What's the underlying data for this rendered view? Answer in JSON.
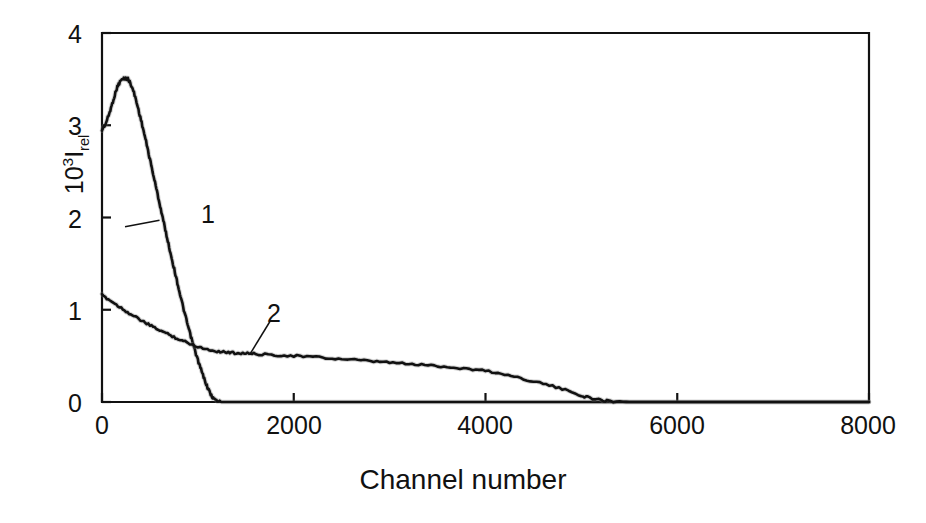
{
  "figure": {
    "background_color": "#ffffff",
    "axis_color": "#111111",
    "curve_color": "#111111"
  },
  "axes": {
    "x_title": "Channel number",
    "y_title_base": "10",
    "y_title_exponent": "3",
    "y_title_symbol": "I",
    "y_title_subscript": "rel",
    "x_ticks": [
      "0",
      "2000",
      "4000",
      "6000",
      "8000"
    ],
    "y_ticks": [
      "0",
      "1",
      "2",
      "3",
      "4"
    ]
  },
  "annotations": {
    "curve_1_label": "1",
    "curve_2_label": "2"
  },
  "chart_data": {
    "type": "line",
    "title": "",
    "xlabel": "Channel number",
    "ylabel": "10^3 I_rel",
    "xlim": [
      0,
      8000
    ],
    "ylim": [
      0,
      4
    ],
    "xticks": [
      0,
      2000,
      4000,
      6000,
      8000
    ],
    "yticks": [
      0,
      1,
      2,
      3,
      4
    ],
    "grid": false,
    "legend": "inline-labels",
    "series": [
      {
        "name": "1",
        "label": "1",
        "label_position": {
          "x": 600,
          "y": 2.03
        },
        "x": [
          0,
          40,
          80,
          120,
          160,
          200,
          240,
          270,
          300,
          340,
          380,
          420,
          460,
          500,
          540,
          580,
          620,
          660,
          700,
          740,
          780,
          820,
          860,
          900,
          940,
          980,
          1020,
          1060,
          1100,
          1140,
          1180,
          1250,
          1400,
          1800,
          2400,
          3200,
          4000,
          5000,
          6000,
          7000,
          8000
        ],
        "y": [
          2.95,
          3.02,
          3.14,
          3.28,
          3.42,
          3.49,
          3.51,
          3.5,
          3.45,
          3.33,
          3.17,
          3.0,
          2.82,
          2.63,
          2.44,
          2.25,
          2.06,
          1.87,
          1.68,
          1.5,
          1.32,
          1.14,
          0.97,
          0.81,
          0.66,
          0.52,
          0.39,
          0.27,
          0.16,
          0.07,
          0.02,
          0.0,
          0.0,
          0.0,
          0.0,
          0.0,
          0.0,
          0.0,
          0.0,
          0.0,
          0.0
        ]
      },
      {
        "name": "2",
        "label": "2",
        "label_position": {
          "x": 1800,
          "y": 0.95
        },
        "x": [
          0,
          100,
          200,
          300,
          400,
          500,
          600,
          700,
          800,
          900,
          1000,
          1100,
          1200,
          1300,
          1400,
          1500,
          1600,
          1800,
          2000,
          2200,
          2400,
          2600,
          2800,
          3000,
          3200,
          3400,
          3600,
          3800,
          4000,
          4200,
          4400,
          4600,
          4800,
          5000,
          5100,
          5200,
          5300,
          5500,
          6000,
          6500,
          7000,
          7500,
          8000
        ],
        "y": [
          1.16,
          1.09,
          1.02,
          0.95,
          0.89,
          0.83,
          0.78,
          0.73,
          0.68,
          0.64,
          0.6,
          0.57,
          0.55,
          0.54,
          0.53,
          0.53,
          0.52,
          0.51,
          0.5,
          0.49,
          0.47,
          0.46,
          0.44,
          0.43,
          0.41,
          0.4,
          0.38,
          0.36,
          0.34,
          0.3,
          0.25,
          0.2,
          0.14,
          0.07,
          0.04,
          0.02,
          0.01,
          0.0,
          0.0,
          0.0,
          0.0,
          0.0,
          0.0
        ]
      }
    ],
    "leader_lines": [
      {
        "series": "1",
        "from": {
          "x": 600,
          "y": 1.97
        },
        "to": {
          "x": 240,
          "y": 1.9
        }
      },
      {
        "series": "2",
        "from": {
          "x": 1750,
          "y": 0.87
        },
        "to": {
          "x": 1550,
          "y": 0.53
        }
      }
    ]
  }
}
